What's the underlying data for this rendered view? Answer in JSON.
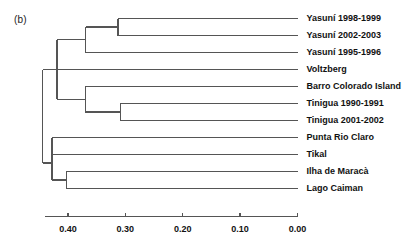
{
  "figure": {
    "panel_label": "(b)",
    "line_color": "#555555",
    "text_color": "#111111",
    "background": "#ffffff"
  },
  "chart_data": {
    "type": "dendrogram",
    "title": "",
    "xlabel": "",
    "ylabel": "",
    "axis_direction": "reversed",
    "xlim": [
      0.44,
      0.0
    ],
    "grid": false,
    "legend": null,
    "tick_values": [
      0.4,
      0.3,
      0.2,
      0.1,
      0.0
    ],
    "tick_labels": [
      "0.40",
      "0.30",
      "0.20",
      "0.10",
      "0.00"
    ],
    "leaves": [
      {
        "label": "Yasuní 1998-1999",
        "order": 0
      },
      {
        "label": "Yasuní 2002-2003",
        "order": 1
      },
      {
        "label": "Yasuní 1995-1996",
        "order": 2
      },
      {
        "label": "Voltzberg",
        "order": 3
      },
      {
        "label": "Barro Colorado Island",
        "order": 4
      },
      {
        "label": "Tinigua 1990-1991",
        "order": 5
      },
      {
        "label": "Tinigua 2001-2002",
        "order": 6
      },
      {
        "label": "Punta Rio Claro",
        "order": 7
      },
      {
        "label": "Tikal",
        "order": 8
      },
      {
        "label": "Ilha de Maracà",
        "order": 9
      },
      {
        "label": "Lago Caiman",
        "order": 10
      }
    ],
    "merges": [
      {
        "id": "n1",
        "children": [
          "Yasuní 1998-1999",
          "Yasuní 2002-2003"
        ],
        "height": 0.313
      },
      {
        "id": "n2",
        "children": [
          "n1",
          "Yasuní 1995-1996"
        ],
        "height": 0.369
      },
      {
        "id": "n3",
        "children": [
          "Tinigua 1990-1991",
          "Tinigua 2001-2002"
        ],
        "height": 0.309
      },
      {
        "id": "n4",
        "children": [
          "Barro Colorado Island",
          "n3"
        ],
        "height": 0.37
      },
      {
        "id": "n5",
        "children": [
          "n2",
          "Voltzberg",
          "n4"
        ],
        "height": 0.419
      },
      {
        "id": "n6",
        "children": [
          "Punta Rio Claro",
          "Tikal"
        ],
        "height": 0.428
      },
      {
        "id": "n7",
        "children": [
          "Ilha de Maracà",
          "Lago Caiman"
        ],
        "height": 0.403
      },
      {
        "id": "n8",
        "children": [
          "n6",
          "n7"
        ],
        "height": 0.428
      },
      {
        "id": "root",
        "children": [
          "n5",
          "n8"
        ],
        "height": 0.444
      }
    ]
  }
}
